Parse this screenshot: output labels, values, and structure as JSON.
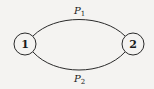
{
  "diagram": {
    "type": "graph",
    "nodes": [
      {
        "id": "1",
        "label": "1",
        "cx": 25,
        "cy": 44,
        "r": 11
      },
      {
        "id": "2",
        "label": "2",
        "cx": 133,
        "cy": 44,
        "r": 11
      }
    ],
    "edges": [
      {
        "from": "1",
        "to": "2",
        "label_base": "P",
        "label_sub": "1",
        "position": "upper"
      },
      {
        "from": "1",
        "to": "2",
        "label_base": "P",
        "label_sub": "2",
        "position": "lower"
      }
    ],
    "colors": {
      "stroke": "#2a2a2a",
      "background": "#f4f3f1",
      "node_fill": "#f4f3f1"
    }
  }
}
